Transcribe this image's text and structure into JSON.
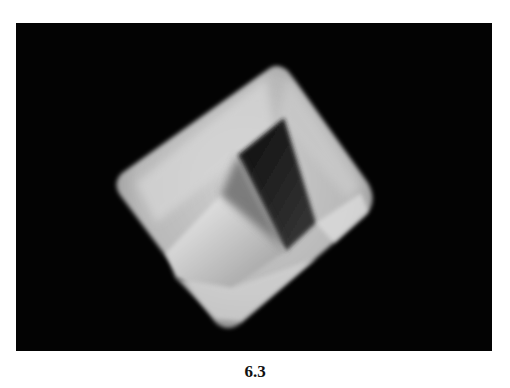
{
  "figure": {
    "caption": "6.3",
    "colors": {
      "background": "#030303",
      "crystal_light": "#e6e6e6",
      "crystal_mid": "#a8a8a8",
      "crystal_dark": "#1a1a1a",
      "page": "#ffffff"
    }
  }
}
